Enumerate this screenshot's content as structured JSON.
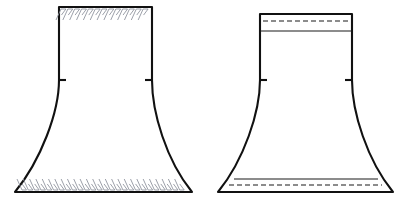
{
  "document": {
    "title": "Skirt Construction Technical Flat — Raw Edge vs Finished Hem",
    "background_color": "#ffffff",
    "width": 413,
    "height": 209
  },
  "style": {
    "outline_color": "#111111",
    "outline_width": 2.1,
    "stitch_color": "#8a8f99",
    "stitch_width": 0.85,
    "fold_line_color": "#1a1a1a",
    "fold_line_width": 1.1,
    "dashed_stitch_color": "#1a1a1a",
    "dashed_stitch_width": 1.2,
    "dash_pattern": "5 3",
    "notch_color": "#111111",
    "notch_width": 2.1,
    "fill_color": "#ffffff"
  },
  "figures": [
    {
      "id": "figure-raw-edge",
      "label": "Raw edge / unfinished skirt panel",
      "side": "left",
      "geometry": {
        "waist_left_x": 59,
        "waist_right_x": 152,
        "waist_top_y": 7,
        "hip_y": 80,
        "hem_left_x": 15,
        "hem_right_x": 192,
        "hem_y": 192,
        "flare_control_left": {
          "x": 50,
          "y": 150
        },
        "flare_control_right": {
          "x": 161,
          "y": 150
        }
      },
      "outline_path": "M 59 7 L 152 7 L 152 80 C 152 112 166 160 192 192 L 15 192 C 41 160 59 112 59 80 Z",
      "edge_finishes": [
        {
          "name": "waist-overlock-stitching",
          "type": "overlock-serger",
          "position": "top",
          "y_baseline": 9,
          "x_start": 61,
          "x_end": 150,
          "stitch_count": 13,
          "stitch_depth": 11,
          "slant": 5
        },
        {
          "name": "hem-overlock-stitching",
          "type": "overlock-serger",
          "position": "bottom",
          "y_baseline": 190,
          "x_start": 22,
          "x_end": 186,
          "stitch_count": 26,
          "stitch_depth": 11,
          "slant": 5
        }
      ],
      "notches": [
        {
          "name": "left-hip-notch",
          "x": 59,
          "y": 80,
          "direction": "right",
          "length": 7
        },
        {
          "name": "right-hip-notch",
          "x": 152,
          "y": 80,
          "direction": "left",
          "length": 7
        }
      ],
      "fold_lines": [],
      "dashed_stitch_lines": []
    },
    {
      "id": "figure-finished-hem",
      "label": "Finished / folded and topstitched skirt panel",
      "side": "right",
      "geometry": {
        "waist_left_x": 260,
        "waist_right_x": 352,
        "waist_top_y": 14,
        "hip_y": 80,
        "hem_left_x": 218,
        "hem_right_x": 393,
        "hem_y": 192,
        "flare_control_left": {
          "x": 252,
          "y": 150
        },
        "flare_control_right": {
          "x": 361,
          "y": 150
        }
      },
      "outline_path": "M 260 14 L 352 14 L 352 80 C 352 112 367 160 393 192 L 218 192 C 244 160 260 112 260 80 Z",
      "edge_finishes": [],
      "notches": [
        {
          "name": "left-hip-notch",
          "x": 260,
          "y": 80,
          "direction": "right",
          "length": 7
        },
        {
          "name": "right-hip-notch",
          "x": 352,
          "y": 80,
          "direction": "left",
          "length": 7
        }
      ],
      "fold_lines": [
        {
          "name": "waistband-fold-line",
          "x1": 260,
          "y1": 31,
          "x2": 352,
          "y2": 31
        },
        {
          "name": "hem-fold-line",
          "x1": 234,
          "y1": 179,
          "x2": 378,
          "y2": 179
        }
      ],
      "dashed_stitch_lines": [
        {
          "name": "waistband-topstitch",
          "x1": 263,
          "y1": 21,
          "x2": 349,
          "y2": 21
        },
        {
          "name": "hem-topstitch",
          "x1": 229,
          "y1": 185,
          "x2": 382,
          "y2": 185
        }
      ]
    }
  ]
}
